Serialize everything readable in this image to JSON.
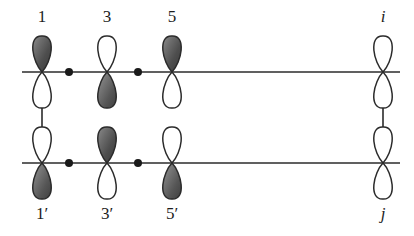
{
  "figure": {
    "type": "orbital-interaction-diagram",
    "background_color": "#ffffff",
    "line_color": "#2b2b2b",
    "lobe_outline_color": "#2b2b2b",
    "lobe_shaded_color": "#5a5a5a",
    "lobe_empty_color": "#ffffff",
    "node_dot_color": "#1a1a1a"
  },
  "rows": [
    {
      "name": "top-chain",
      "axis_y": 72,
      "label_y": 8,
      "label_position": "above",
      "orbitals": [
        {
          "label": "1",
          "x": 42,
          "shaded_lobe": "top",
          "italic": false
        },
        {
          "label": "3",
          "x": 107,
          "shaded_lobe": "bottom",
          "italic": false
        },
        {
          "label": "5",
          "x": 172,
          "shaded_lobe": "top",
          "italic": false
        },
        {
          "label": "i",
          "x": 383,
          "shaded_lobe": "none",
          "italic": true
        }
      ],
      "node_dots": [
        {
          "x": 69
        },
        {
          "x": 138
        }
      ],
      "bond_line": {
        "x1": 22,
        "x2": 400
      }
    },
    {
      "name": "bottom-chain",
      "axis_y": 163,
      "label_y": 205,
      "label_position": "below",
      "orbitals": [
        {
          "label": "1′",
          "x": 42,
          "shaded_lobe": "bottom",
          "italic": false
        },
        {
          "label": "3′",
          "x": 107,
          "shaded_lobe": "top",
          "italic": false
        },
        {
          "label": "5′",
          "x": 172,
          "shaded_lobe": "bottom",
          "italic": false
        },
        {
          "label": "j",
          "x": 383,
          "shaded_lobe": "none",
          "italic": true
        }
      ],
      "node_dots": [
        {
          "x": 69
        },
        {
          "x": 138
        }
      ],
      "bond_line": {
        "x1": 22,
        "x2": 400
      }
    }
  ],
  "vertical_connectors": [
    {
      "name": "left-connector",
      "x": 42,
      "y1": 108,
      "y2": 127
    },
    {
      "name": "right-connector",
      "x": 383,
      "y1": 108,
      "y2": 127
    }
  ],
  "geometry": {
    "lobe_half_height": 36,
    "lobe_half_width": 15,
    "node_dot_radius": 4
  }
}
